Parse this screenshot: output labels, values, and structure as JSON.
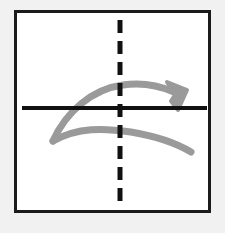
{
  "figure": {
    "background_color": "#f1f1f1",
    "panel_color": "#ffffff",
    "frame": {
      "border_color": "#1b1b1b",
      "border_width": 3,
      "x": 14,
      "y": 10,
      "width": 197,
      "height": 203
    },
    "axes": {
      "horizontal": {
        "label": "horizontal axis",
        "style": "solid",
        "color": "#111111",
        "stroke_width": 4,
        "x1": 22,
        "y1": 108,
        "x2": 207,
        "y2": 108
      },
      "vertical": {
        "label": "vertical axis",
        "style": "dashed",
        "color": "#111111",
        "stroke_width": 5,
        "dash_length": 13,
        "gap_length": 8,
        "x": 120,
        "y1": 20,
        "y2": 203
      }
    },
    "shapes": [
      {
        "name": "upper-curved-arrow",
        "role": "original",
        "color": "#9a9a9a",
        "stroke_width": 7,
        "has_arrowhead": true,
        "arrowhead_direction": "down-right",
        "arrowhead_tip_x": 186,
        "arrowhead_tip_y": 108,
        "start_x": 52,
        "start_y": 141,
        "peak_x": 126,
        "peak_y": 85,
        "description": "Arc rising from lower-left point, cresting above the horizontal axis, terminating in an arrowhead at the right on the axis"
      },
      {
        "name": "lower-curved-arc",
        "role": "reflection",
        "color": "#9a9a9a",
        "stroke_width": 7,
        "has_arrowhead": false,
        "start_x": 52,
        "start_y": 141,
        "trough_x": 120,
        "trough_y": 131,
        "end_x": 191,
        "end_y": 152,
        "description": "Mirrored arc below the horizontal axis sharing the left point, sweeping down to the right"
      }
    ]
  }
}
